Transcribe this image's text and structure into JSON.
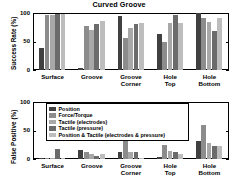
{
  "figure": {
    "title": "Curved Groove",
    "background": "#ffffff"
  },
  "series_colors": [
    "#404040",
    "#8c8c8c",
    "#a8a8a8",
    "#6b6b6b",
    "#bdbdbd"
  ],
  "legend": {
    "position": "top-center-overlay-bottom-panel",
    "entries": [
      "Position",
      "Force/Torque",
      "Tactile (electrodes)",
      "Tactile (pressure)",
      "Position & Tactile (electrodes & pressure)"
    ]
  },
  "chart_data": [
    {
      "type": "bar",
      "title": "Curved Groove",
      "xlabel": "",
      "ylabel": "Success Rate (%)",
      "ylim": [
        0,
        100
      ],
      "yticks": [
        0,
        50,
        100
      ],
      "ytick_labels": [
        "0",
        "50",
        "100"
      ],
      "grid": false,
      "legend_position": "none",
      "categories": [
        "Surface",
        "Groove",
        "Groove\nCorner",
        "Hole\nTop",
        "Hole\nBottom"
      ],
      "series": [
        {
          "name": "Position",
          "values": [
            38,
            3,
            95,
            64,
            100
          ]
        },
        {
          "name": "Force/Torque",
          "values": [
            97,
            78,
            56,
            50,
            92
          ]
        },
        {
          "name": "Tactile (electrodes)",
          "values": [
            97,
            70,
            74,
            83,
            85
          ]
        },
        {
          "name": "Tactile (pressure)",
          "values": [
            98,
            81,
            80,
            96,
            69
          ]
        },
        {
          "name": "Position & Tactile (electrodes & pressure)",
          "values": [
            98,
            86,
            82,
            82,
            92
          ]
        }
      ]
    },
    {
      "type": "bar",
      "title": "",
      "xlabel": "",
      "ylabel": "False Positive (%)",
      "ylim": [
        0,
        100
      ],
      "yticks": [
        0,
        50,
        100
      ],
      "ytick_labels": [
        "0",
        "50",
        "100"
      ],
      "grid": false,
      "legend_position": "upper-center",
      "categories": [
        "Surface",
        "Groove",
        "Groove\nCorner",
        "Hole\nTop",
        "Hole\nBottom"
      ],
      "series": [
        {
          "name": "Position",
          "values": [
            1,
            16,
            12,
            3,
            31
          ]
        },
        {
          "name": "Force/Torque",
          "values": [
            2,
            12,
            78,
            24,
            59
          ]
        },
        {
          "name": "Tactile (electrodes)",
          "values": [
            1,
            9,
            13,
            14,
            28
          ]
        },
        {
          "name": "Tactile (pressure)",
          "values": [
            17,
            5,
            13,
            13,
            22
          ]
        },
        {
          "name": "Position & Tactile (electrodes & pressure)",
          "values": [
            1,
            9,
            2,
            8,
            23
          ]
        }
      ]
    }
  ]
}
